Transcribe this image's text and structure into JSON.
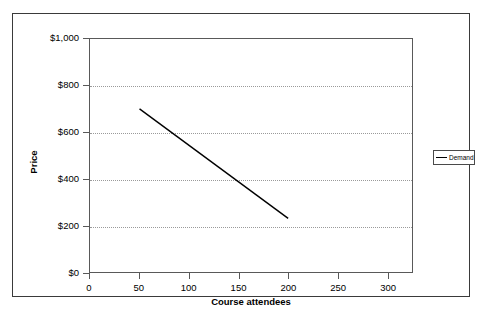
{
  "chart_data": {
    "type": "line",
    "title": "",
    "xlabel": "Course attendees",
    "ylabel": "Price",
    "xlim": [
      0,
      325
    ],
    "ylim": [
      0,
      1000
    ],
    "grid": true,
    "grid_axis": "y",
    "legend_position": "right",
    "x_ticks": [
      0,
      50,
      100,
      150,
      200,
      250,
      300
    ],
    "x_tick_labels": [
      "0",
      "50",
      "100",
      "150",
      "200",
      "250",
      "300"
    ],
    "y_ticks": [
      0,
      200,
      400,
      600,
      800,
      1000
    ],
    "y_tick_labels": [
      "$0",
      "$200",
      "$400",
      "$600",
      "$800",
      "$1,000"
    ],
    "series": [
      {
        "name": "Demand",
        "color": "#000000",
        "x": [
          50,
          200
        ],
        "values": [
          700,
          230
        ]
      }
    ]
  },
  "legend": {
    "entries": [
      {
        "label": "Demand",
        "color": "#000000"
      }
    ]
  },
  "axes": {
    "x_title": "Course attendees",
    "y_title": "Price"
  },
  "colors": {
    "frame": "#3a3a3a",
    "axis": "#595959",
    "gridline": "#9a9a9a",
    "series": "#000000",
    "background": "#ffffff"
  }
}
